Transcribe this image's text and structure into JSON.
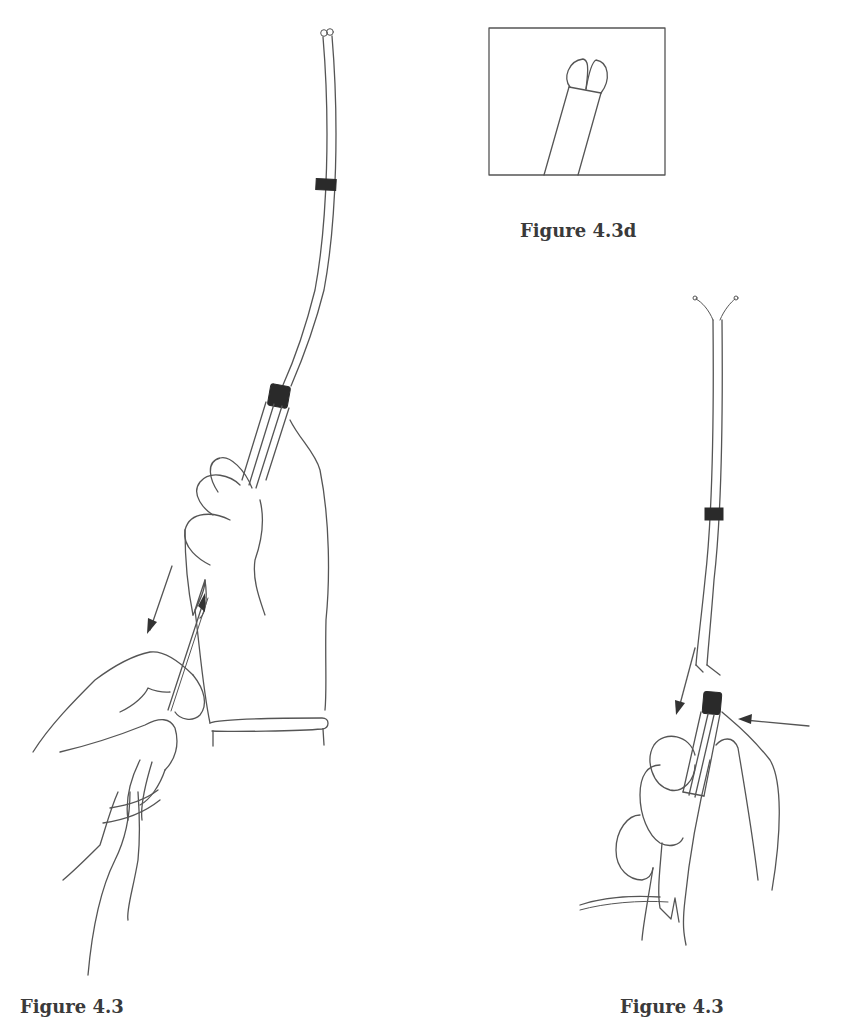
{
  "figures": {
    "inset": {
      "caption": "Figure 4.3d",
      "description": "Close-up of catheter tip with split/bilobed end inside rectangular frame"
    },
    "left": {
      "caption": "Figure 4.3",
      "caption_note": "partially visible, cut off at bottom edge",
      "description": "Gloved hand holding catheter introducer vertically; second hand pulling wire downward (arrow)"
    },
    "right": {
      "caption": "Figure 4.3",
      "caption_note": "partially visible, cut off at bottom edge",
      "description": "Hand holding catheter sheath; arrow pointing down along catheter and arrow pointing left at sheath junction"
    }
  },
  "colors": {
    "line": "#555555",
    "band": "#2a2a2a",
    "background": "#ffffff"
  }
}
